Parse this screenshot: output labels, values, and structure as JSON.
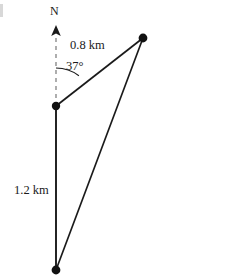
{
  "figure": {
    "type": "vector-diagram",
    "stroke_color": "#1a1a1a",
    "dash_color": "#8c8c8c",
    "background": "#ffffff",
    "canvas": {
      "width": 250,
      "height": 276
    },
    "points": {
      "origin": {
        "name": "vertex-origin",
        "x": 56,
        "y": 106
      },
      "upper_right": {
        "name": "vertex-upper-right",
        "x": 143,
        "y": 38
      },
      "bottom": {
        "name": "vertex-bottom",
        "x": 56,
        "y": 270
      }
    },
    "north_arrow": {
      "tip_x": 56,
      "tip_y": 26,
      "base_x": 56,
      "base_y": 106,
      "style": "dashed-with-solid-arrowhead"
    },
    "angle_arc": {
      "center_x": 56,
      "center_y": 106,
      "radius": 38,
      "from_deg": 0,
      "to_deg": 37
    },
    "segments": [
      {
        "name": "north-reference",
        "from": "origin",
        "to": "arrow-tip",
        "style": "dashed"
      },
      {
        "name": "segment-0.8km",
        "from": "origin",
        "to": "upper_right",
        "style": "solid"
      },
      {
        "name": "segment-1.2km",
        "from": "origin",
        "to": "bottom",
        "style": "solid"
      },
      {
        "name": "segment-closing",
        "from": "bottom",
        "to": "upper_right",
        "style": "solid"
      }
    ]
  },
  "labels": {
    "north": "N",
    "side_a": "0.8 km",
    "angle": "37°",
    "side_b": "1.2 km"
  }
}
